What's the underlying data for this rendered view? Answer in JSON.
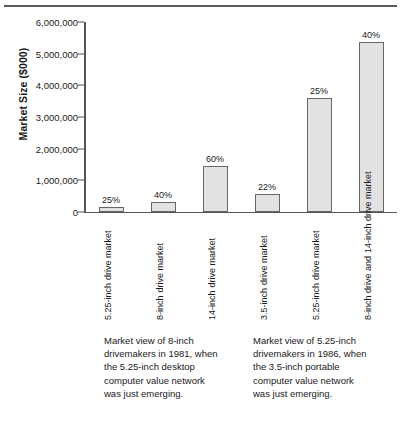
{
  "chart_data": {
    "type": "bar",
    "title": "",
    "xlabel": "",
    "ylabel": "Market Size ($000)",
    "ylim": [
      0,
      6000000
    ],
    "grid": false,
    "legend": "none",
    "ytick_labels": [
      "6,000,000",
      "5,000,000",
      "4,000,000",
      "3,000,000",
      "2,000,000",
      "1,000,000",
      "0"
    ],
    "ytick_values": [
      6000000,
      5000000,
      4000000,
      3000000,
      2000000,
      1000000,
      0
    ],
    "categories": [
      "5.25-inch drive market",
      "8-inch drive market",
      "14-inch drive market",
      "3.5-inch drive market",
      "5.25-inch drive market",
      "8-inch drive and 14-inch drive market"
    ],
    "category_lines": [
      [
        "5.25-inch",
        "drive market"
      ],
      [
        "8-inch",
        "drive market"
      ],
      [
        "14-inch",
        "drive market"
      ],
      [
        "3.5-inch",
        "drive market"
      ],
      [
        "5.25-inch",
        "drive market"
      ],
      [
        "8-inch drive and",
        "14-inch drive market"
      ]
    ],
    "values": [
      150000,
      320000,
      1450000,
      570000,
      3600000,
      5370000
    ],
    "data_labels": [
      "25%",
      "40%",
      "60%",
      "22%",
      "25%",
      "40%"
    ],
    "bar_fill_color": "#e2e2e2",
    "bar_border_color": "#666666",
    "axis_color": "#555555"
  },
  "captions": {
    "left": "Market view of 8-inch\ndrivemakers in 1981, when\nthe 5.25-inch desktop\ncomputer value network\nwas just emerging.",
    "right": "Market view of 5.25-inch\ndrivemakers in 1986, when\nthe 3.5-inch portable\ncomputer value network\nwas just emerging."
  }
}
